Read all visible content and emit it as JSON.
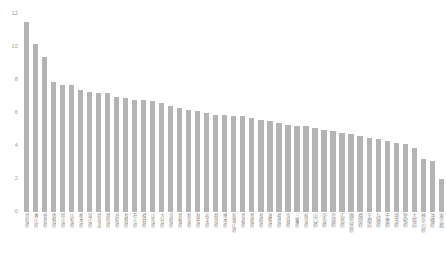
{
  "chart_data": {
    "type": "bar",
    "title": "",
    "subtitle": "",
    "xlabel": "",
    "ylabel": "",
    "ylim": [
      0,
      12
    ],
    "y_ticks": [
      0,
      2,
      4,
      6,
      8,
      10,
      12
    ],
    "y_tick_labels": [
      "0",
      "2",
      "4",
      "6",
      "8",
      "10",
      "12"
    ],
    "grid": false,
    "legend": null,
    "bar_color": "#b4b4b4",
    "tick_label_color": "#9a9a9a",
    "background_color": "#ffffff",
    "orientation": "vertical",
    "sorted": "descending",
    "categories": [
      "鳥取県",
      "香川県",
      "徳島県",
      "佐賀県",
      "岡山県",
      "山梨県",
      "栃木県",
      "富山県",
      "北海道",
      "静岡県",
      "高知県",
      "長野県",
      "石川県",
      "福井県",
      "山形県",
      "大分県",
      "宮崎県",
      "島根県",
      "新潟県",
      "秋田県",
      "岩手県",
      "群馬県",
      "熊本県",
      "和歌山県",
      "青森県",
      "愛媛県",
      "長崎県",
      "滋賀県",
      "福島県",
      "宮城県",
      "三重県",
      "岐阜県",
      "山口県",
      "奈良県",
      "茨城県",
      "広島県",
      "鹿児島県",
      "福岡県",
      "京都府",
      "兵庫県",
      "千葉県",
      "埼玉県",
      "愛知県",
      "大阪府",
      "神奈川県",
      "沖縄県",
      "東京都"
    ],
    "values": [
      11.5,
      10.2,
      9.4,
      7.9,
      7.7,
      7.7,
      7.4,
      7.3,
      7.2,
      7.2,
      7.0,
      6.9,
      6.8,
      6.8,
      6.7,
      6.6,
      6.4,
      6.3,
      6.2,
      6.1,
      6.0,
      5.9,
      5.9,
      5.8,
      5.8,
      5.7,
      5.6,
      5.5,
      5.4,
      5.3,
      5.2,
      5.2,
      5.1,
      5.0,
      4.9,
      4.8,
      4.7,
      4.6,
      4.5,
      4.4,
      4.3,
      4.2,
      4.1,
      3.9,
      3.2,
      3.1,
      2.0
    ]
  }
}
